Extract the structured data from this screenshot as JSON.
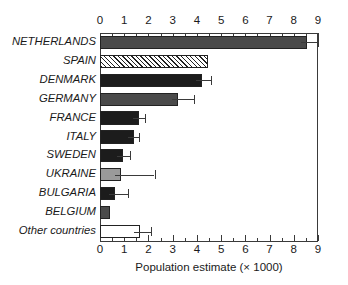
{
  "chart_data": {
    "type": "bar",
    "orientation": "horizontal",
    "title": "",
    "xlabel": "Population estimate (× 1000)",
    "ylabel": "",
    "xlim": [
      0,
      9
    ],
    "xticks": [
      0,
      1,
      2,
      3,
      4,
      5,
      6,
      7,
      8,
      9
    ],
    "xtick_labels": [
      "0",
      "1",
      "2",
      "3",
      "4",
      "5",
      "6",
      "7",
      "8",
      "9"
    ],
    "minor_tick_step": 0.5,
    "grid": false,
    "legend": null,
    "axis_positions": [
      "top",
      "bottom"
    ],
    "categories": [
      "NETHERLANDS",
      "SPAIN",
      "DENMARK",
      "GERMANY",
      "FRANCE",
      "ITALY",
      "SWEDEN",
      "UKRAINE",
      "BULGARIA",
      "BELGIUM",
      "Other countries"
    ],
    "values": [
      8.55,
      4.45,
      4.2,
      3.2,
      1.6,
      1.4,
      0.95,
      0.85,
      0.6,
      0.42,
      1.65
    ],
    "error_high": [
      9.0,
      4.45,
      4.6,
      3.9,
      1.85,
      1.6,
      1.25,
      2.25,
      1.15,
      null,
      2.1
    ],
    "fills": [
      "dark-gray",
      "diagonal-hatch",
      "black",
      "dark-gray",
      "black",
      "black",
      "black",
      "mid-gray",
      "black",
      "dark-gray",
      "white"
    ],
    "colors": {
      "dark-gray": "#4a4a4a",
      "black": "#1c1c1c",
      "mid-gray": "#9a9a9a",
      "white": "#ffffff",
      "outline": "#222222",
      "axis": "#3a3a3a"
    }
  }
}
